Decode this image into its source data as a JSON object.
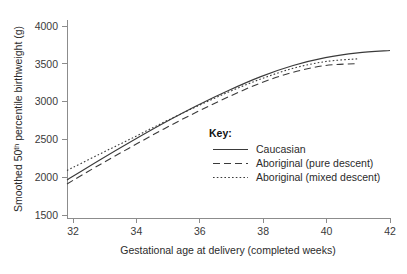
{
  "chart_data": {
    "type": "line",
    "title": "",
    "xlabel": "Gestational age at delivery (completed weeks)",
    "ylabel": "Smoothed 50th percentile birthweight (g)",
    "ylabel_prefix": "Smoothed 50",
    "ylabel_superscript": "th",
    "ylabel_suffix": " percentile birthweight (g)",
    "xlim": [
      32,
      42
    ],
    "ylim": [
      1500,
      4000
    ],
    "xticks": [
      32,
      34,
      36,
      38,
      40,
      42
    ],
    "xtick_labels": [
      "32",
      "34",
      "36",
      "38",
      "40",
      "42"
    ],
    "yticks": [
      1500,
      2000,
      2500,
      3000,
      3500,
      4000
    ],
    "ytick_labels": [
      "1500",
      "2000",
      "2500",
      "3000",
      "3500",
      "4000"
    ],
    "grid": false,
    "legend_position": "center-right-inside",
    "legend_title": "Key:",
    "x": [
      32,
      33,
      34,
      35,
      36,
      37,
      38,
      39,
      40,
      41,
      42
    ],
    "series": [
      {
        "name": "Caucasian",
        "style": "solid",
        "color": "#3a3a3a",
        "x": [
          32,
          33,
          34,
          35,
          36,
          37,
          38,
          39,
          40,
          41,
          42
        ],
        "values": [
          1980,
          2230,
          2470,
          2700,
          2915,
          3110,
          3285,
          3425,
          3525,
          3585,
          3615
        ]
      },
      {
        "name": "Aboriginal (pure descent)",
        "style": "dashed",
        "color": "#3a3a3a",
        "x": [
          32,
          33,
          34,
          35,
          36,
          37,
          38,
          39,
          40,
          41
        ],
        "values": [
          1930,
          2170,
          2400,
          2625,
          2835,
          3030,
          3205,
          3340,
          3425,
          3450
        ]
      },
      {
        "name": "Aboriginal (mixed descent)",
        "style": "dotted",
        "color": "#3a3a3a",
        "x": [
          32,
          33,
          34,
          35,
          36,
          37,
          38,
          39,
          40,
          41
        ],
        "values": [
          2100,
          2305,
          2505,
          2710,
          2905,
          3090,
          3255,
          3390,
          3475,
          3510
        ]
      }
    ]
  },
  "legend": {
    "title": "Key:",
    "items": [
      {
        "label": "Caucasian",
        "style": "solid"
      },
      {
        "label": "Aboriginal (pure descent)",
        "style": "dashed"
      },
      {
        "label": "Aboriginal (mixed descent)",
        "style": "dotted"
      }
    ]
  },
  "axes": {
    "x_title": "Gestational age at delivery (completed weeks)",
    "y_title_prefix": "Smoothed 50",
    "y_title_superscript": "th",
    "y_title_suffix": " percentile birthweight (g)",
    "x_tick_labels": [
      "32",
      "34",
      "36",
      "38",
      "40",
      "42"
    ],
    "y_tick_labels": [
      "1500",
      "2000",
      "2500",
      "3000",
      "3500",
      "4000"
    ]
  }
}
